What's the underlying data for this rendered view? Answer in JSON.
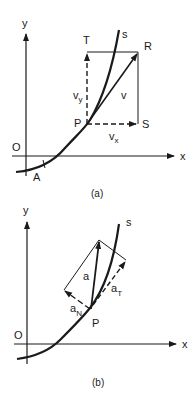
{
  "figure_a": {
    "caption": "(a)",
    "axis_x": "x",
    "axis_y": "y",
    "origin": "O",
    "curve": "s",
    "points": {
      "A": "A",
      "P": "P",
      "T": "T",
      "R": "R",
      "S": "S"
    },
    "vectors": {
      "v": "v",
      "vx": "v",
      "vx_sub": "x",
      "vy": "v",
      "vy_sub": "y"
    }
  },
  "figure_b": {
    "caption": "(b)",
    "axis_x": "x",
    "axis_y": "y",
    "origin": "O",
    "curve": "s",
    "points": {
      "P": "P"
    },
    "vectors": {
      "a": "a",
      "aT": "a",
      "aT_sub": "T",
      "aN": "a",
      "aN_sub": "N"
    }
  },
  "colors": {
    "ink": "#1a1a1a",
    "background": "#ffffff"
  }
}
